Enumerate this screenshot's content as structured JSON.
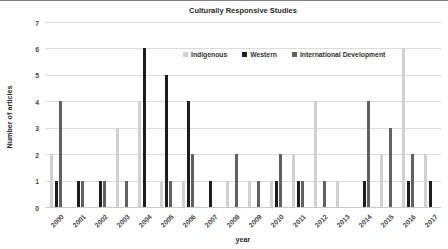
{
  "chart_data": {
    "type": "bar",
    "title": "Culturally Responsive Studies",
    "xlabel": "year",
    "ylabel": "Number of articles",
    "ylim": [
      0,
      7
    ],
    "yticks": [
      "0",
      "1",
      "2",
      "3",
      "4",
      "5",
      "6",
      "7"
    ],
    "grid": true,
    "legend_position": "inside-top-center",
    "categories": [
      "2000",
      "2001",
      "2002",
      "2003",
      "2004",
      "2005",
      "2006",
      "2007",
      "2008",
      "2009",
      "2010",
      "2011",
      "2012",
      "2013",
      "2014",
      "2015",
      "2016",
      "2017"
    ],
    "series": [
      {
        "name": "Indigenous",
        "color": "#d1d1d1",
        "values": [
          2,
          0,
          0,
          3,
          4,
          1,
          1,
          0,
          1,
          1,
          1,
          2,
          4,
          1,
          0,
          2,
          6,
          2
        ]
      },
      {
        "name": "Western",
        "color": "#1d1d1d",
        "values": [
          1,
          1,
          1,
          0,
          6,
          5,
          4,
          1,
          0,
          0,
          1,
          1,
          0,
          0,
          1,
          0,
          1,
          1
        ]
      },
      {
        "name": "International Development",
        "color": "#616161",
        "values": [
          4,
          1,
          1,
          1,
          0,
          1,
          2,
          0,
          2,
          1,
          2,
          1,
          1,
          0,
          4,
          3,
          2,
          0
        ]
      }
    ]
  }
}
